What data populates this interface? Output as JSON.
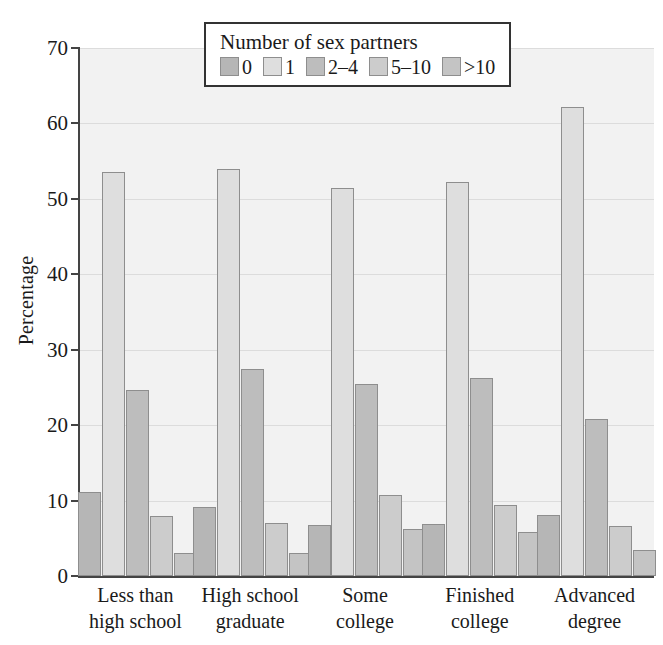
{
  "chart_data": {
    "type": "bar",
    "title": "",
    "xlabel": "",
    "ylabel": "Percentage",
    "ylim": [
      0,
      70
    ],
    "yticks": [
      0,
      10,
      20,
      30,
      40,
      50,
      60,
      70
    ],
    "ytick_labels": [
      "0",
      "10",
      "20",
      "30",
      "40",
      "50",
      "60",
      "70"
    ],
    "grid": true,
    "legend_position": "top-center",
    "legend_title": "Number of sex partners",
    "categories": [
      "Less than high school",
      "High school graduate",
      "Some college",
      "Finished college",
      "Advanced degree"
    ],
    "category_lines": [
      [
        "Less than",
        "high school"
      ],
      [
        "High school",
        "graduate"
      ],
      [
        "Some",
        "college"
      ],
      [
        "Finished",
        "college"
      ],
      [
        "Advanced",
        "degree"
      ]
    ],
    "series": [
      {
        "name": "0",
        "color": "#b6b6b6",
        "values": [
          11.2,
          9.2,
          6.8,
          6.9,
          8.1
        ]
      },
      {
        "name": "1",
        "color": "#dedede",
        "values": [
          53.5,
          54.0,
          51.5,
          52.2,
          62.2
        ]
      },
      {
        "name": "2-4",
        "color": "#bdbdbd",
        "values": [
          24.6,
          27.5,
          25.5,
          26.3,
          20.8
        ]
      },
      {
        "name": "5-10",
        "color": "#cccccc",
        "values": [
          8.0,
          7.0,
          10.8,
          9.4,
          6.6
        ]
      },
      {
        "name": ">10",
        "color": "#c4c4c4",
        "values": [
          3.0,
          3.1,
          6.2,
          5.9,
          3.5
        ]
      }
    ],
    "legend_entries": [
      {
        "label": "0",
        "color": "#b6b6b6"
      },
      {
        "label": "1",
        "color": "#dedede"
      },
      {
        "label": "2–4",
        "color": "#bdbdbd"
      },
      {
        "label": "5–10",
        "color": "#cccccc"
      },
      {
        "label": ">10",
        "color": "#c4c4c4"
      }
    ],
    "plot_background": "#f2f2f2",
    "axis_color": "#444444",
    "grid_color": "#dcdcdc"
  }
}
